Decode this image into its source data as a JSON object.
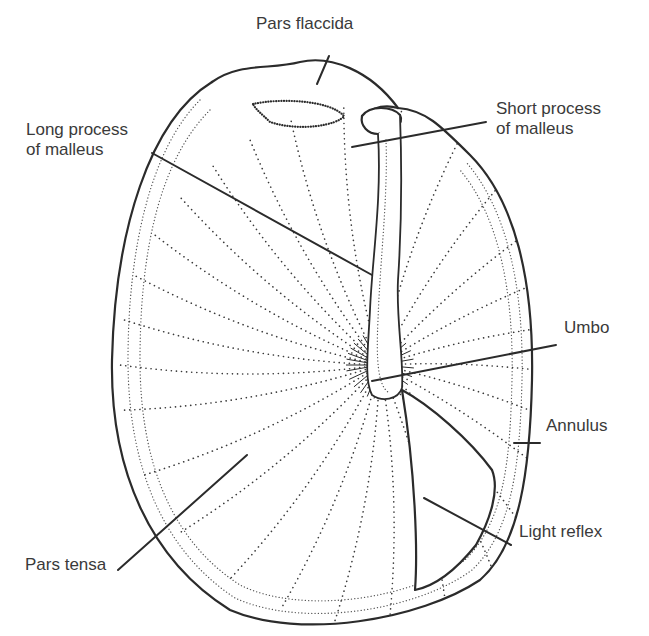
{
  "figure": {
    "background": "#ffffff",
    "ink_color": "#2b2b2b",
    "text_color": "#3a3a3a"
  },
  "labels": {
    "pars_flaccida": {
      "text": "Pars flaccida",
      "x": 256,
      "y": 30,
      "line": [
        329,
        56,
        317,
        84
      ]
    },
    "long_process": {
      "text": "Long process\nof malleus",
      "x": 26,
      "y": 136,
      "line": [
        152,
        153,
        372,
        275
      ]
    },
    "short_process": {
      "text": "Short process\nof malleus",
      "x": 496,
      "y": 115,
      "line": [
        486,
        122,
        352,
        147
      ]
    },
    "umbo": {
      "text": "Umbo",
      "x": 564,
      "y": 334,
      "line": [
        556,
        345,
        372,
        381
      ]
    },
    "annulus": {
      "text": "Annulus",
      "x": 546,
      "y": 432,
      "line": [
        514,
        443,
        540,
        443
      ]
    },
    "light_reflex": {
      "text": "Light reflex",
      "x": 519,
      "y": 538,
      "line": [
        424,
        498,
        511,
        545
      ]
    },
    "pars_tensa": {
      "text": "Pars tensa",
      "x": 25,
      "y": 571,
      "line": [
        118,
        570,
        247,
        455
      ]
    }
  },
  "structures": {
    "annulus_outer": "M212,82 C150,120 115,230 112,360 C110,470 150,560 230,610 C300,640 420,620 480,580 C520,545 530,470 532,380 C534,280 515,200 470,155 C440,125 425,110 398,108",
    "annulus_inner": "M210,110 C160,160 140,250 140,360 C140,460 170,540 240,585 C300,615 410,600 465,560 C505,520 510,460 512,380 C514,290 498,215 460,170",
    "pars_flaccida_rim": "M212,82 C240,62 270,70 300,62 C330,55 370,70 398,108",
    "pars_flaccida_pocket": "M253,104 C280,98 330,100 344,116 C338,125 300,132 270,122 C262,114 256,110 253,104 Z",
    "short_process_knob": "M362,116 C370,105 392,106 400,115 C405,125 392,130 378,134 C368,134 360,126 362,116 Z",
    "malleus_handle": "M378,134 C382,200 372,260 370,310 C368,350 364,380 372,395 C382,402 398,400 402,388 C404,360 396,320 398,280 C402,220 402,170 400,115",
    "light_reflex": "M402,390 C430,405 470,440 492,470 C500,490 490,520 476,545 C460,565 440,585 415,590 C418,550 415,470 402,390 Z",
    "fiber_center": [
      380,
      365
    ],
    "fiber_angles_deg": [
      190,
      200,
      210,
      220,
      230,
      240,
      250,
      262,
      275,
      290,
      305,
      320,
      335,
      350,
      5,
      20,
      35,
      50,
      62,
      75,
      88,
      100,
      112,
      125,
      140,
      155,
      170,
      180
    ],
    "fiber_length": 260
  }
}
